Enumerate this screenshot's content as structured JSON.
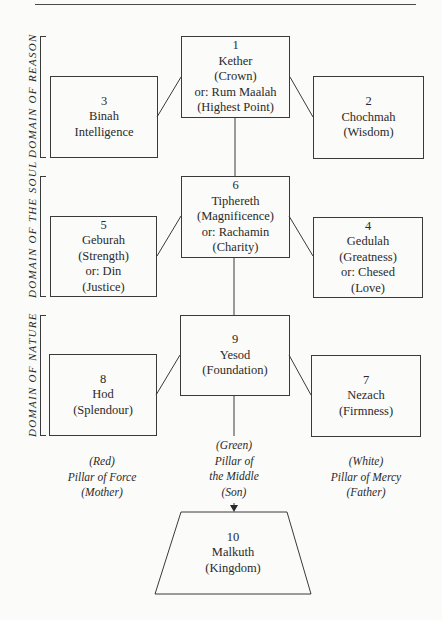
{
  "diagram": {
    "domains": [
      {
        "id": "reason",
        "label": "DOMAIN OF REASON"
      },
      {
        "id": "soul",
        "label": "DOMAIN OF THE SOUL"
      },
      {
        "id": "nature",
        "label": "DOMAIN OF NATURE"
      }
    ],
    "sephiroth": {
      "kether": {
        "number": "1",
        "lines": [
          "Kether",
          "(Crown)",
          "or: Rum Maalah",
          "(Highest Point)"
        ]
      },
      "chochmah": {
        "number": "2",
        "lines": [
          "Chochmah",
          "(Wisdom)"
        ]
      },
      "binah": {
        "number": "3",
        "lines": [
          "Binah",
          "Intelligence"
        ]
      },
      "gedulah": {
        "number": "4",
        "lines": [
          "Gedulah",
          "(Greatness)",
          "or:  Chesed",
          "(Love)"
        ]
      },
      "geburah": {
        "number": "5",
        "lines": [
          "Geburah",
          "(Strength)",
          "or:  Din",
          "(Justice)"
        ]
      },
      "tiphereth": {
        "number": "6",
        "lines": [
          "Tiphereth",
          "(Magnificence)",
          "or:  Rachamin",
          "(Charity)"
        ]
      },
      "nezach": {
        "number": "7",
        "lines": [
          "Nezach",
          "(Firmness)"
        ]
      },
      "hod": {
        "number": "8",
        "lines": [
          "Hod",
          "(Splendour)"
        ]
      },
      "yesod": {
        "number": "9",
        "lines": [
          "Yesod",
          "(Foundation)"
        ]
      },
      "malkuth": {
        "number": "10",
        "lines": [
          "Malkuth",
          "(Kingdom)"
        ]
      }
    },
    "pillars": {
      "force": {
        "lines": [
          "(Red)",
          "Pillar of Force",
          "(Mother)"
        ]
      },
      "middle": {
        "lines": [
          "(Green)",
          "Pillar of",
          "the Middle",
          "(Son)"
        ]
      },
      "mercy": {
        "lines": [
          "(White)",
          "Pillar of Mercy",
          "(Father)"
        ]
      }
    },
    "colors": {
      "line": "#3a3a3a",
      "paper": "#fbfbf9",
      "text": "#2a2a2a"
    }
  }
}
